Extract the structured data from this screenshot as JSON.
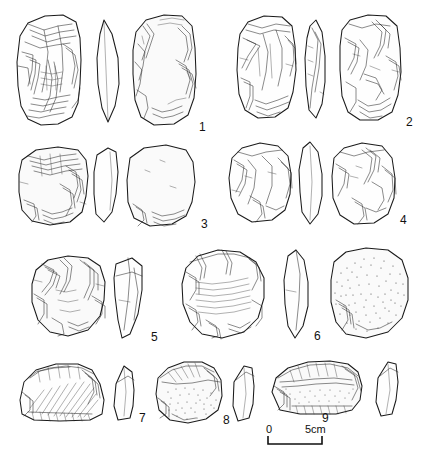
{
  "figure": {
    "type": "archaeological-lithic-plate",
    "medium": "pen-and-ink line drawing",
    "background_color": "#ffffff",
    "ink_color": "#1b1b1b",
    "item_count": 9,
    "views_note": "each artefact shown as dorsal view, profile/section, and ventral view"
  },
  "labels": {
    "n1": "1",
    "n2": "2",
    "n3": "3",
    "n4": "4",
    "n5": "5",
    "n6": "6",
    "n7": "7",
    "n8": "8",
    "n9": "9"
  },
  "scale": {
    "zero_label": "0",
    "max_label": "5cm",
    "units": "cm",
    "length_cm": 5
  },
  "artefacts": [
    {
      "number": "1",
      "row": 1,
      "column": "left",
      "description": "large rectangular core with invasive flake scars and ripple hatching",
      "views": [
        "dorsal",
        "profile",
        "ventral"
      ]
    },
    {
      "number": "2",
      "row": 1,
      "column": "right",
      "description": "elongated rectangular core, heavily flaked on both faces",
      "views": [
        "dorsal",
        "profile",
        "ventral"
      ]
    },
    {
      "number": "3",
      "row": 2,
      "column": "left",
      "description": "squat core with cortical surface and marginal retouch",
      "views": [
        "dorsal",
        "profile",
        "ventral"
      ]
    },
    {
      "number": "4",
      "row": 2,
      "column": "right",
      "description": "oval core with broad removals and pointed profile",
      "views": [
        "dorsal",
        "profile",
        "ventral"
      ]
    },
    {
      "number": "5",
      "row": 3,
      "column": "left",
      "description": "sub-circular core with peripheral flaking",
      "views": [
        "dorsal",
        "profile"
      ]
    },
    {
      "number": "6",
      "row": 3,
      "column": "right",
      "description": "discoidal core, ripple-marked dorsal face and stippled ventral face",
      "views": [
        "dorsal",
        "profile",
        "ventral"
      ]
    },
    {
      "number": "7",
      "row": 4,
      "column": "left",
      "description": "side scraper with hatched ventral face and steep retouched edge",
      "views": [
        "dorsal",
        "profile"
      ]
    },
    {
      "number": "8",
      "row": 4,
      "column": "centre",
      "description": "rounded scraper with stippled surface",
      "views": [
        "dorsal",
        "profile"
      ]
    },
    {
      "number": "9",
      "row": 4,
      "column": "right",
      "description": "elongate scraper with convex retouched edge and stippled body",
      "views": [
        "dorsal",
        "profile"
      ]
    }
  ]
}
